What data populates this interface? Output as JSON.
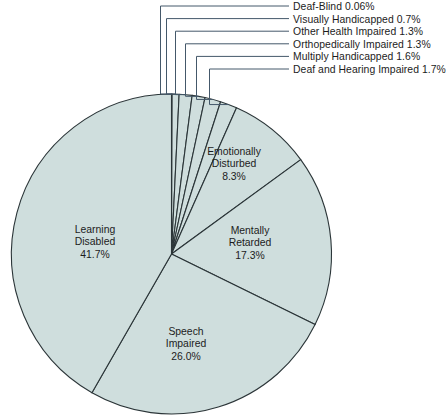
{
  "chart_data": {
    "type": "pie",
    "title": "",
    "subtitle": "",
    "xlabel": "",
    "ylabel": "",
    "grid": false,
    "legend_position": "callout-labels-top-right",
    "units": "percent",
    "start_angle_deg": -90,
    "direction": "clockwise",
    "colors": {
      "slice_fill": "#cfdedd",
      "slice_stroke": "#2b3538",
      "leader_line": "#44586a",
      "text": "#1c1c1c",
      "background": "#ffffff"
    },
    "geometry": {
      "center_x": 171.5,
      "center_y": 254,
      "radius": 160
    },
    "categories": [
      "Deaf-Blind",
      "Visually Handicapped",
      "Other Health Impaired",
      "Orthopedically Impaired",
      "Multiply Handicapped",
      "Deaf and Hearing Impaired",
      "Emotionally Disturbed",
      "Mentally Retarded",
      "Speech Impaired",
      "Learning Disabled"
    ],
    "values": [
      0.06,
      0.7,
      1.3,
      1.3,
      1.6,
      1.7,
      8.3,
      17.3,
      26.0,
      41.7
    ],
    "value_labels": [
      "0.06%",
      "0.7%",
      "1.3%",
      "1.3%",
      "1.6%",
      "1.7%",
      "8.3%",
      "17.3%",
      "26.0%",
      "41.7%"
    ],
    "slices": [
      {
        "label": "Deaf-Blind",
        "value": 0.06,
        "value_label": "0.06%",
        "label_style": "callout"
      },
      {
        "label": "Visually Handicapped",
        "value": 0.7,
        "value_label": "0.7%",
        "label_style": "callout"
      },
      {
        "label": "Other Health Impaired",
        "value": 1.3,
        "value_label": "1.3%",
        "label_style": "callout"
      },
      {
        "label": "Orthopedically Impaired",
        "value": 1.3,
        "value_label": "1.3%",
        "label_style": "callout"
      },
      {
        "label": "Multiply Handicapped",
        "value": 1.6,
        "value_label": "1.6%",
        "label_style": "callout"
      },
      {
        "label": "Deaf and Hearing Impaired",
        "value": 1.7,
        "value_label": "1.7%",
        "label_style": "callout"
      },
      {
        "label": "Emotionally Disturbed",
        "value": 8.3,
        "value_label": "8.3%",
        "label_style": "inside"
      },
      {
        "label": "Mentally Retarded",
        "value": 17.3,
        "value_label": "17.3%",
        "label_style": "inside"
      },
      {
        "label": "Speech Impaired",
        "value": 26.0,
        "value_label": "26.0%",
        "label_style": "inside"
      },
      {
        "label": "Learning Disabled",
        "value": 41.7,
        "value_label": "41.7%",
        "label_style": "inside"
      }
    ]
  },
  "callouts": [
    {
      "text": "Deaf-Blind 0.06%"
    },
    {
      "text": "Visually Handicapped 0.7%"
    },
    {
      "text": "Other Health Impaired 1.3%"
    },
    {
      "text": "Orthopedically Impaired 1.3%"
    },
    {
      "text": "Multiply Handicapped 1.6%"
    },
    {
      "text": "Deaf and Hearing Impaired 1.7%"
    }
  ],
  "inside_labels": [
    {
      "line1": "Emotionally",
      "line2": "Disturbed",
      "line3": "8.3%"
    },
    {
      "line1": "Mentally",
      "line2": "Retarded",
      "line3": "17.3%"
    },
    {
      "line1": "Speech",
      "line2": "Impaired",
      "line3": "26.0%"
    },
    {
      "line1": "Learning",
      "line2": "Disabled",
      "line3": "41.7%"
    }
  ]
}
